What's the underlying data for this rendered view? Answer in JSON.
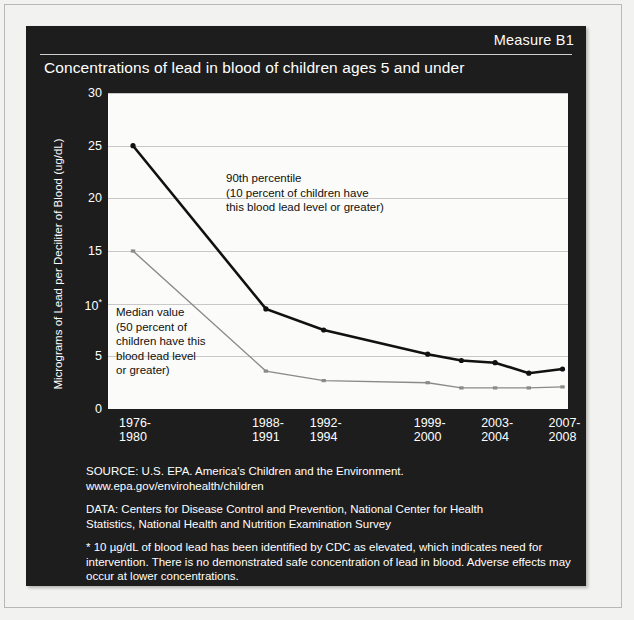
{
  "panel": {
    "measure_tag": "Measure B1",
    "title": "Concentrations of lead in blood of children ages 5 and under"
  },
  "axes": {
    "y_title": "Micrograms of Lead per Deciliter of Blood (ug/dL)",
    "y_ticks": [
      "30",
      "25",
      "20",
      "15",
      "10",
      "5",
      "0"
    ],
    "y_tick_asterisk_at": "10",
    "x_ticks": [
      {
        "line1": "1976-",
        "line2": "1980"
      },
      {
        "line1": "1988-",
        "line2": "1991"
      },
      {
        "line1": "1992-",
        "line2": "1994"
      },
      {
        "line1": "1999-",
        "line2": "2000"
      },
      {
        "line1": "2003-",
        "line2": "2004"
      },
      {
        "line1": "2007-",
        "line2": "2008"
      }
    ]
  },
  "annotations": {
    "p90": {
      "line1": "90th percentile",
      "line2": "(10 percent of children have",
      "line3": "this blood lead level or greater)"
    },
    "median": {
      "line1": "Median value",
      "line2": "(50 percent of",
      "line3": "children have this",
      "line4": "blood lead level",
      "line5": "or greater)"
    }
  },
  "footer": {
    "source": "SOURCE: U.S. EPA. America's Children and the Environment.",
    "source_url": "www.epa.gov/envirohealth/children",
    "data_line1": "DATA: Centers for Disease Control and Prevention, National Center for Health",
    "data_line2": "Statistics, National Health and Nutrition Examination Survey",
    "footnote": "* 10 µg/dL of blood lead has been identified by CDC as elevated, which indicates need for intervention. There is no demonstrated safe concentration of lead in blood. Adverse effects may occur at lower concentrations."
  },
  "colors": {
    "panel_bg": "#1d1d1d",
    "plot_bg": "#fbfbf9",
    "grid": "#c8c8c8",
    "p90_line": "#111111",
    "median_line": "#8a8a8a",
    "text_on_dark": "#ffffff"
  },
  "chart_data": {
    "type": "line",
    "title": "Concentrations of lead in blood of children ages 5 and under",
    "xlabel": "",
    "ylabel": "Micrograms of Lead per Deciliter of Blood (ug/dL)",
    "ylim": [
      0,
      30
    ],
    "ytick_values": [
      0,
      5,
      10,
      15,
      20,
      25,
      30
    ],
    "grid": true,
    "legend": "in-plot annotations",
    "categories": [
      "1976-1980",
      "1988-1991",
      "1992-1994",
      "1999-2000",
      "2001-2002",
      "2003-2004",
      "2005-2006",
      "2007-2008"
    ],
    "labeled_categories": [
      "1976-1980",
      "1988-1991",
      "1992-1994",
      "1999-2000",
      "2003-2004",
      "2007-2008"
    ],
    "series": [
      {
        "name": "90th percentile",
        "color": "#111111",
        "values": [
          25.0,
          9.5,
          7.5,
          5.2,
          4.6,
          4.4,
          3.4,
          3.8
        ]
      },
      {
        "name": "Median value",
        "color": "#8a8a8a",
        "values": [
          15.0,
          3.6,
          2.7,
          2.5,
          2.0,
          2.0,
          2.0,
          2.1
        ]
      }
    ]
  }
}
